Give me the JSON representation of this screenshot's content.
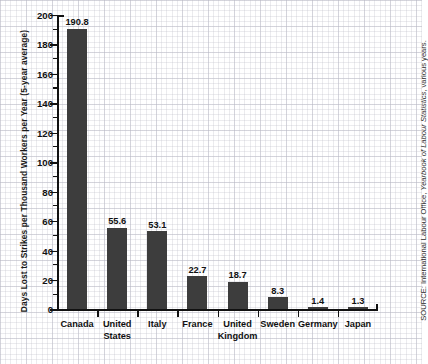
{
  "chart_data": {
    "type": "bar",
    "title": "",
    "subtitle": "",
    "xlabel": "",
    "ylabel": "Days Lost to Strikes per Thousand Workers per Year (5-year average)",
    "ylim": [
      0,
      200
    ],
    "ytick_step": 20,
    "yticks": [
      "0",
      "20",
      "40",
      "60",
      "80",
      "100",
      "120",
      "140",
      "160",
      "180",
      "200"
    ],
    "grid": false,
    "legend": null,
    "bar_color": "#3d3d3d",
    "categories": [
      "Canada",
      "United\nStates",
      "Italy",
      "France",
      "United\nKingdom",
      "Sweden",
      "Germany",
      "Japan"
    ],
    "values": [
      190.8,
      55.6,
      53.1,
      22.7,
      18.7,
      8.3,
      1.4,
      1.3
    ],
    "value_labels": [
      "190.8",
      "55.6",
      "53.1",
      "22.7",
      "18.7",
      "8.3",
      "1.4",
      "1.3"
    ]
  },
  "source": {
    "prefix": "SOURCE: International Labour Office, ",
    "italic": "Yearbook of Labour Statistics",
    "suffix": ", various years."
  }
}
